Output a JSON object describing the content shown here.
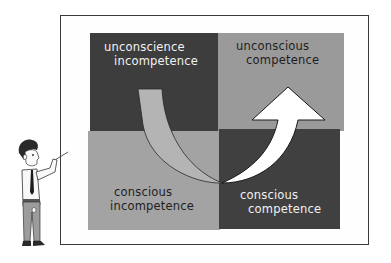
{
  "diagram": {
    "type": "four-quadrant learning model",
    "quadrants": [
      {
        "position": "top-left",
        "line1": "unconscience",
        "line2": "incompetence",
        "shade": "#3d3d3d",
        "text_color": "#f2f2f2"
      },
      {
        "position": "top-right",
        "line1": "unconscious",
        "line2": "competence",
        "shade": "#9a9a9a",
        "text_color": "#1e1e1e"
      },
      {
        "position": "bottom-left",
        "line1": "conscious",
        "line2": "incompetence",
        "shade": "#a3a3a3",
        "text_color": "#1e1e1e"
      },
      {
        "position": "bottom-right",
        "line1": "conscious",
        "line2": "competence",
        "shade": "#404040",
        "text_color": "#f2f2f2"
      }
    ],
    "arrow": {
      "from": "top-left",
      "via": [
        "bottom-left",
        "bottom-right"
      ],
      "to": "top-right",
      "tail_color": "#b4b4b4",
      "head_color": "#ffffff"
    },
    "presenter": {
      "description": "cartoon man in white shirt and tie pointing at board"
    }
  }
}
